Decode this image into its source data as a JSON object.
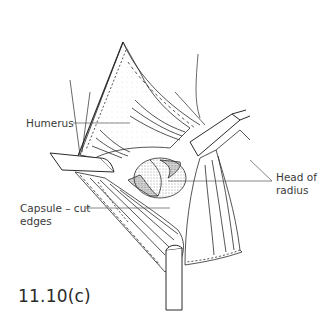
{
  "figure": {
    "number": "11.10(c)",
    "labels": {
      "humerus": "Humerus",
      "head_of_radius_line1": "Head of",
      "head_of_radius_line2": "radius",
      "capsule_line1": "Capsule – cut",
      "capsule_line2": "edges"
    },
    "colors": {
      "ink": "#2a2a2a",
      "leader_line": "#555555",
      "background": "#ffffff"
    }
  }
}
